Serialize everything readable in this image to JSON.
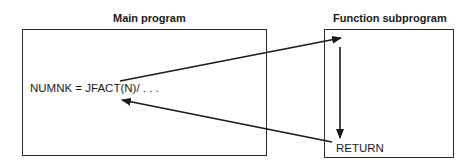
{
  "diagram": {
    "main_program": {
      "title": "Main program",
      "statement": "NUMNK = JFACT(N)/ . . ."
    },
    "function_subprogram": {
      "title": "Function subprogram",
      "statement": "RETURN"
    },
    "arrows": [
      {
        "name": "call-arrow",
        "from": "JFACT(N) in main program",
        "to": "top of function subprogram"
      },
      {
        "name": "execution-flow-arrow",
        "from": "top of function subprogram",
        "to": "RETURN"
      },
      {
        "name": "return-arrow",
        "from": "RETURN",
        "to": "JFACT(N) in main program"
      }
    ],
    "colors": {
      "line": "#1a1a1a",
      "background": "#ffffff"
    }
  }
}
